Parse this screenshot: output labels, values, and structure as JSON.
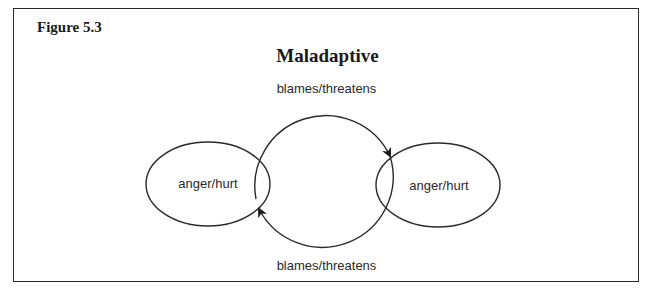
{
  "figure": {
    "label": "Figure 5.3",
    "title": "Maladaptive"
  },
  "diagram": {
    "nodes": [
      {
        "id": "left",
        "label": "anger/hurt"
      },
      {
        "id": "right",
        "label": "anger/hurt"
      }
    ],
    "edges": [
      {
        "from": "left",
        "to": "right",
        "label": "blames/threatens",
        "position": "top"
      },
      {
        "from": "right",
        "to": "left",
        "label": "blames/threatens",
        "position": "bottom"
      }
    ],
    "colors": {
      "stroke": "#2a2a2a",
      "background": "#ffffff"
    }
  }
}
